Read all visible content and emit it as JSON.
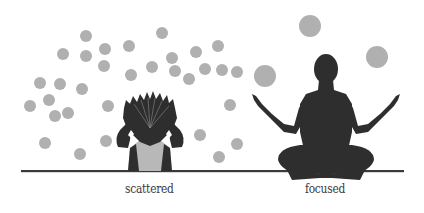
{
  "illustration": {
    "left_figure": {
      "label": "scattered",
      "description": "person clutching head with spiky hair, surrounded by many small grey circles"
    },
    "right_figure": {
      "label": "focused",
      "description": "meditating person in lotus pose with few large grey circles above"
    }
  },
  "colors": {
    "background": "#ffffff",
    "circle": "#b0b0b0",
    "figure": "#2e2e2e",
    "shirt": "#b8b8b8",
    "ground": "#3a3a3a",
    "text": "#3a3a3a"
  },
  "scattered_circles": [
    [
      86,
      36
    ],
    [
      63,
      54
    ],
    [
      86,
      56
    ],
    [
      105,
      49
    ],
    [
      129,
      46
    ],
    [
      162,
      33
    ],
    [
      104,
      66
    ],
    [
      40,
      83
    ],
    [
      60,
      84
    ],
    [
      82,
      89
    ],
    [
      131,
      75
    ],
    [
      152,
      67
    ],
    [
      172,
      58
    ],
    [
      196,
      52
    ],
    [
      218,
      46
    ],
    [
      30,
      106
    ],
    [
      49,
      100
    ],
    [
      55,
      116
    ],
    [
      68,
      113
    ],
    [
      108,
      106
    ],
    [
      132,
      108
    ],
    [
      175,
      71
    ],
    [
      189,
      79
    ],
    [
      205,
      69
    ],
    [
      222,
      70
    ],
    [
      45,
      143
    ],
    [
      80,
      154
    ],
    [
      106,
      141
    ],
    [
      200,
      135
    ],
    [
      219,
      157
    ],
    [
      237,
      72
    ],
    [
      230,
      105
    ],
    [
      237,
      144
    ]
  ],
  "focused_circles": [
    [
      310,
      26,
      11
    ],
    [
      377,
      57,
      11
    ],
    [
      265,
      76,
      11
    ]
  ]
}
